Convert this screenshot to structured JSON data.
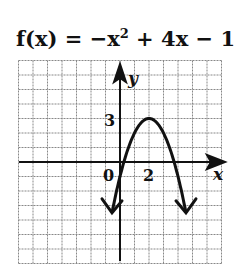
{
  "chart_data": {
    "type": "line",
    "function": "f(x) = -x^2 + 4x - 1",
    "xlabel": "x",
    "ylabel": "y",
    "xlim": [
      -7,
      7
    ],
    "ylim": [
      -7,
      7
    ],
    "grid": true,
    "tick_labels": {
      "origin": "0",
      "x": [
        "2"
      ],
      "y": [
        "3"
      ]
    },
    "vertex": [
      2,
      3
    ],
    "x": [
      -0.6,
      0,
      0.27,
      1,
      2,
      3,
      3.73,
      4,
      4.6
    ],
    "y": [
      -3.76,
      -1,
      0,
      2,
      3,
      2,
      0,
      -1,
      -3.76
    ]
  },
  "labels": {
    "title_prefix": "f(x) = −x",
    "title_exp": "2",
    "title_suffix": " + 4x − 1",
    "x_axis": "x",
    "y_axis": "y",
    "origin": "0",
    "x_tick": "2",
    "y_tick": "3"
  }
}
